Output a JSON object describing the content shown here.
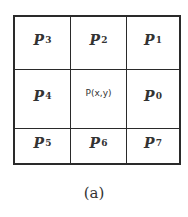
{
  "figure": {
    "caption": "(a)",
    "grid": [
      [
        {
          "base": "P",
          "sub": "3"
        },
        {
          "base": "P",
          "sub": "2"
        },
        {
          "base": "P",
          "sub": "1"
        }
      ],
      [
        {
          "base": "P",
          "sub": "4"
        },
        {
          "label": "P(x,y)"
        },
        {
          "base": "P",
          "sub": "0"
        }
      ],
      [
        {
          "base": "P",
          "sub": "5"
        },
        {
          "base": "P",
          "sub": "6"
        },
        {
          "base": "P",
          "sub": "7"
        }
      ]
    ]
  }
}
